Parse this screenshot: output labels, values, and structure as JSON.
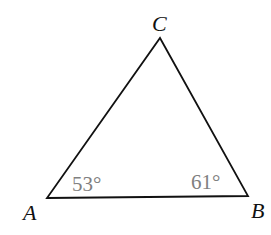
{
  "diagram": {
    "type": "triangle",
    "vertices": {
      "A": {
        "label": "A",
        "x": 47,
        "y": 198
      },
      "B": {
        "label": "B",
        "x": 248,
        "y": 196
      },
      "C": {
        "label": "C",
        "x": 160,
        "y": 38
      }
    },
    "angles": {
      "A": {
        "label": "53°",
        "value": 53
      },
      "B": {
        "label": "61°",
        "value": 61
      }
    },
    "colors": {
      "stroke": "#111111",
      "vertex_label": "#111111",
      "angle_label": "#808080"
    }
  }
}
